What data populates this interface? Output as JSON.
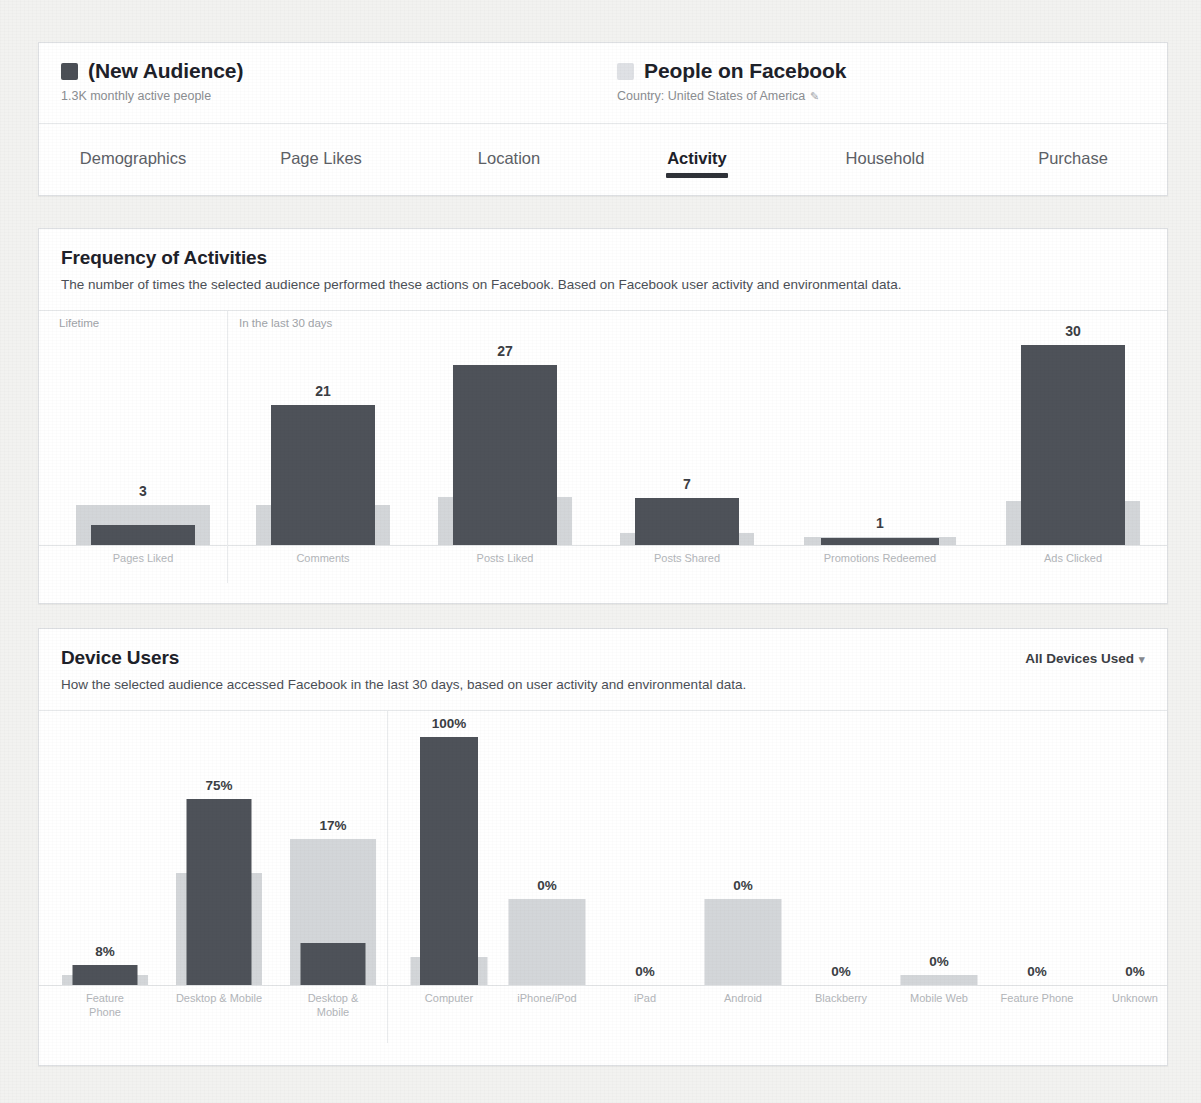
{
  "header": {
    "audience": {
      "swatch_color": "#4b4f56",
      "title": "(New Audience)",
      "subtitle": "1.3K monthly active people"
    },
    "comparison": {
      "swatch_color": "#dfe1e5",
      "title": "People on Facebook",
      "subtitle": "Country: United States of America",
      "edit_icon": "pencil-icon",
      "edit_glyph": "✎"
    },
    "tabs": [
      {
        "label": "Demographics",
        "active": false
      },
      {
        "label": "Page Likes",
        "active": false
      },
      {
        "label": "Location",
        "active": false
      },
      {
        "label": "Activity",
        "active": true
      },
      {
        "label": "Household",
        "active": false
      },
      {
        "label": "Purchase",
        "active": false
      }
    ]
  },
  "frequency_section": {
    "title": "Frequency of Activities",
    "description": "The number of times the selected audience performed these actions on Facebook. Based on Facebook user activity and environmental data.",
    "group_labels": [
      "Lifetime",
      "In the last 30 days"
    ]
  },
  "device_section": {
    "title": "Device Users",
    "description": "How the selected audience accessed Facebook in the last 30 days, based on user activity and environmental data.",
    "dropdown_label": "All Devices Used",
    "dropdown_caret": "▾"
  },
  "colors": {
    "selected_bar": "#4e5259",
    "comparison_bar": "#d3d6d9",
    "page_background": "#f2f2f0",
    "card_background": "#ffffff",
    "card_border": "#dddfe2",
    "heading_text": "#1d2129",
    "muted_text": "#a0a3a8"
  },
  "chart_data": [
    {
      "id": "frequency-of-activities",
      "type": "bar",
      "title": "Frequency of Activities",
      "xlabel": "",
      "ylabel": "",
      "grid": false,
      "legend": [
        "(New Audience)",
        "People on Facebook"
      ],
      "group_labels": [
        "Lifetime",
        "In the last 30 days"
      ],
      "groups": [
        {
          "label": "Lifetime",
          "categories": [
            "Pages Liked"
          ]
        },
        {
          "label": "In the last 30 days",
          "categories": [
            "Comments",
            "Posts Liked",
            "Posts Shared",
            "Promotions Redeemed",
            "Ads Clicked"
          ]
        }
      ],
      "categories": [
        "Pages Liked",
        "Comments",
        "Posts Liked",
        "Posts Shared",
        "Promotions Redeemed",
        "Ads Clicked"
      ],
      "series": [
        {
          "name": "(New Audience)",
          "values": [
            3,
            21,
            27,
            7,
            1,
            30
          ],
          "labels": [
            "3",
            "21",
            "27",
            "7",
            "1",
            "30"
          ]
        },
        {
          "name": "People on Facebook",
          "values": [
            1,
            1,
            1.2,
            0.3,
            0.2,
            1.1
          ],
          "labels": [
            "",
            "",
            "",
            "",
            "",
            ""
          ]
        }
      ]
    },
    {
      "id": "device-users-summary",
      "type": "bar",
      "title": "Device Users",
      "xlabel": "",
      "ylabel": "",
      "grid": false,
      "ylim": [
        0,
        100
      ],
      "categories": [
        "Desktop Only",
        "Desktop & Mobile",
        "Mobile Only"
      ],
      "series": [
        {
          "name": "(New Audience)",
          "values": [
            8,
            75,
            17
          ],
          "labels": [
            "8%",
            "75%",
            "17%"
          ]
        },
        {
          "name": "People on Facebook",
          "values": [
            5,
            44,
            57
          ],
          "labels": [
            "",
            "",
            ""
          ]
        }
      ]
    },
    {
      "id": "device-users-detail",
      "type": "bar",
      "title": "Device Users by device",
      "xlabel": "",
      "ylabel": "",
      "grid": false,
      "ylim": [
        0,
        100
      ],
      "categories": [
        "Computer",
        "iPhone/iPod",
        "iPad",
        "Android",
        "Blackberry",
        "Mobile Web",
        "Feature Phone",
        "Unknown"
      ],
      "series": [
        {
          "name": "(New Audience)",
          "values": [
            100,
            0,
            0,
            0,
            0,
            0,
            0,
            0
          ],
          "labels": [
            "100%",
            "0%",
            "0%",
            "0%",
            "0%",
            "0%",
            "0%",
            "0%"
          ]
        },
        {
          "name": "People on Facebook",
          "values": [
            12,
            33,
            0,
            33,
            0,
            3,
            0,
            0
          ],
          "labels": [
            "",
            "",
            "",
            "",
            "",
            "",
            "",
            ""
          ]
        }
      ]
    }
  ]
}
